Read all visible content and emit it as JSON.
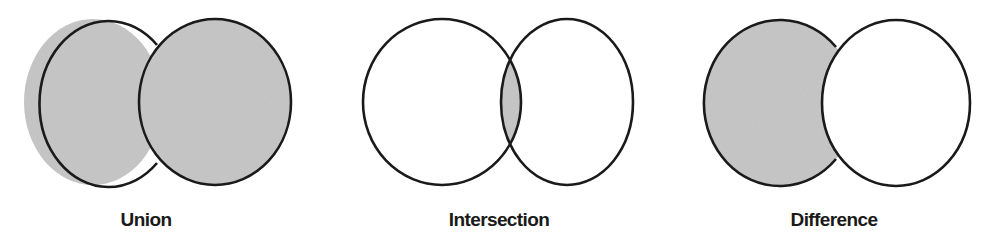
{
  "figure": {
    "shade_color": "#c8c8c8",
    "outline_color": "#1a1a1a",
    "background_color": "#ffffff",
    "panels": [
      {
        "id": "union",
        "label": "Union",
        "shaded_region": "A ∪ B"
      },
      {
        "id": "intersection",
        "label": "Intersection",
        "shaded_region": "A ∩ B"
      },
      {
        "id": "difference",
        "label": "Difference",
        "shaded_region": "A − B"
      }
    ]
  }
}
